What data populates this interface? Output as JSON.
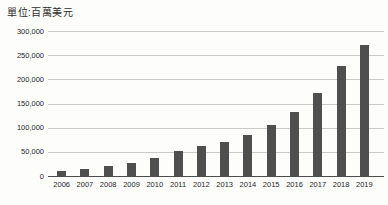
{
  "header": {
    "unit_label": "單位:百萬美元"
  },
  "colors": {
    "bar": "#4f4f4f",
    "gridline": "#c9c9c9",
    "axis_line": "#4d4d4d",
    "text": "#262626",
    "background": "#fdfdfc"
  },
  "chart_data": {
    "type": "bar",
    "title": "單位:百萬美元",
    "categories": [
      "2006",
      "2007",
      "2008",
      "2009",
      "2010",
      "2011",
      "2012",
      "2013",
      "2014",
      "2015",
      "2016",
      "2017",
      "2018",
      "2019"
    ],
    "values": [
      10000,
      15000,
      20000,
      26000,
      37000,
      51000,
      62000,
      71000,
      85000,
      105000,
      133000,
      172000,
      228000,
      272000
    ],
    "xlabel": "",
    "ylabel": "",
    "ylim": [
      0,
      300000
    ],
    "ytick_interval": 50000,
    "yticks": [
      0,
      50000,
      100000,
      150000,
      200000,
      250000,
      300000
    ],
    "ytick_labels": [
      "0",
      "50,000",
      "100,000",
      "150,000",
      "200,000",
      "250,000",
      "300,000"
    ],
    "grid": true,
    "legend_position": "none"
  }
}
